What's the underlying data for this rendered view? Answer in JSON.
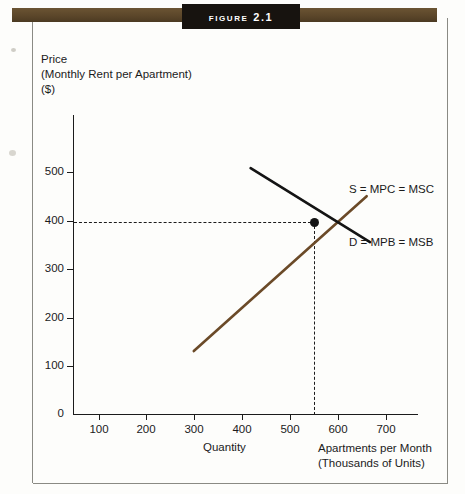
{
  "figure": {
    "tab_label": "Figure 2.1"
  },
  "axes": {
    "y_caption_line1": "Price",
    "y_caption_line2": "(Monthly Rent per Apartment)",
    "y_caption_line3": "($)",
    "x_caption_left": "Quantity",
    "x_caption_right_line1": "Apartments per Month",
    "x_caption_right_line2": "(Thousands of Units)"
  },
  "labels": {
    "supply": "S = MPC = MSC",
    "demand": "D = MPB = MSB"
  },
  "colors": {
    "band_brown": "#5a4529",
    "tab_black": "#17130f",
    "supply_curve": "#6b4a28",
    "demand_curve": "#141414",
    "axis": "#1b1b1b",
    "page": "#fdfdfb"
  },
  "chart_data": {
    "type": "line",
    "title": "Figure 2.1",
    "xlabel": "Apartments per Month (Thousands of Units)",
    "ylabel": "Price (Monthly Rent per Apartment) ($)",
    "xlim": [
      0,
      760
    ],
    "ylim": [
      0,
      560
    ],
    "xticks": [
      100,
      200,
      300,
      400,
      500,
      600,
      700
    ],
    "yticks": [
      0,
      100,
      200,
      300,
      400,
      500
    ],
    "grid": false,
    "legend": "inline-right",
    "series": [
      {
        "name": "S = MPC = MSC",
        "color": "#6b4a28",
        "points": [
          [
            253,
            130
          ],
          [
            615,
            450
          ]
        ]
      },
      {
        "name": "D = MPB = MSB",
        "color": "#141414",
        "points": [
          [
            372,
            508
          ],
          [
            622,
            355
          ]
        ]
      }
    ],
    "annotations": [
      {
        "type": "equilibrium-point",
        "x": 550,
        "y": 400,
        "guides": [
          "horizontal-dashed-to-y-axis",
          "vertical-dashed-to-x-axis"
        ]
      }
    ]
  }
}
